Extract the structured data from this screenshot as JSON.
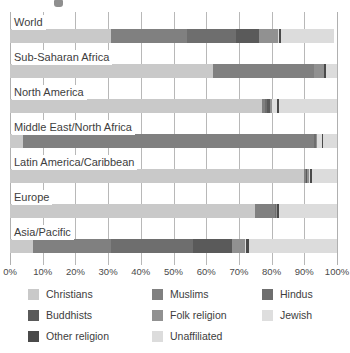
{
  "chart_data": {
    "type": "bar",
    "orientation": "horizontal",
    "stacked": true,
    "title": "",
    "xlabel": "",
    "ylabel": "",
    "xlim": [
      0,
      100
    ],
    "grid": true,
    "legend_position": "bottom",
    "tick_labels": [
      "0%",
      "10%",
      "20%",
      "30%",
      "40%",
      "50%",
      "60%",
      "70%",
      "80%",
      "90%",
      "100%"
    ],
    "tick_values": [
      0,
      10,
      20,
      30,
      40,
      50,
      60,
      70,
      80,
      90,
      100
    ],
    "categories": [
      "World",
      "Sub-Saharan Africa",
      "North America",
      "Middle East/North Africa",
      "Latin America/Caribbean",
      "Europe",
      "Asia/Pacific"
    ],
    "series": [
      {
        "name": "Christians",
        "color": "#c9c9c9",
        "values": [
          31.0,
          62.0,
          77.0,
          4.0,
          90.0,
          75.0,
          7.0
        ]
      },
      {
        "name": "Muslims",
        "color": "#808080",
        "values": [
          23.0,
          31.0,
          1.0,
          89.0,
          0.5,
          6.0,
          24.0
        ]
      },
      {
        "name": "Hindus",
        "color": "#6e6e6e",
        "values": [
          15.0,
          0.0,
          0.5,
          0.5,
          0.0,
          0.2,
          25.0
        ]
      },
      {
        "name": "Buddhists",
        "color": "#5a5a5a",
        "values": [
          7.0,
          0.0,
          1.0,
          0.2,
          0.2,
          0.2,
          12.0
        ]
      },
      {
        "name": "Folk religion",
        "color": "#919191",
        "values": [
          6.0,
          3.0,
          0.5,
          0.2,
          0.8,
          0.2,
          4.0
        ]
      },
      {
        "name": "Jewish",
        "color": "#dedede",
        "values": [
          0.2,
          0.1,
          1.8,
          1.6,
          0.2,
          0.2,
          0.1
        ]
      },
      {
        "name": "Other religion",
        "color": "#4a4a4a",
        "values": [
          0.8,
          0.4,
          0.6,
          0.1,
          0.6,
          0.4,
          0.9
        ]
      },
      {
        "name": "Unaffiliated",
        "color": "#dcdcdc",
        "values": [
          16.0,
          3.5,
          17.6,
          4.4,
          7.7,
          18.0,
          27.0
        ]
      }
    ]
  },
  "legend": {
    "items": [
      {
        "label": "Christians",
        "color": "#c9c9c9"
      },
      {
        "label": "Muslims",
        "color": "#808080"
      },
      {
        "label": "Hindus",
        "color": "#6e6e6e"
      },
      {
        "label": "Buddhists",
        "color": "#5a5a5a"
      },
      {
        "label": "Folk religion",
        "color": "#919191"
      },
      {
        "label": "Jewish",
        "color": "#dedede"
      },
      {
        "label": "Other religion",
        "color": "#4a4a4a"
      },
      {
        "label": "Unaffiliated",
        "color": "#dcdcdc"
      }
    ]
  }
}
